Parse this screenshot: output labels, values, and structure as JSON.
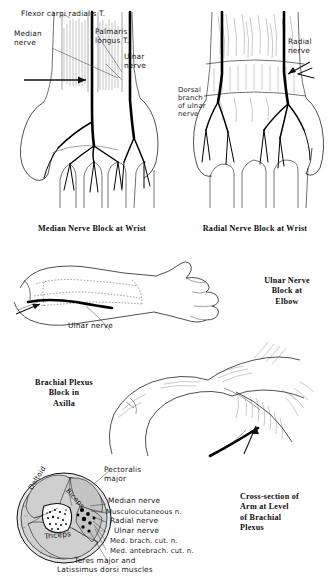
{
  "plate": {
    "title": "Regional nerve block techniques of the upper limb",
    "style": "pen-and-ink anatomical line drawings with handwritten labels"
  },
  "panels": [
    {
      "id": "median-nerve-block-wrist",
      "caption": "Median Nerve Block at Wrist",
      "view": "volar (palmar) aspect of wrist and hand",
      "labels": [
        {
          "name": "flexor-carpi-radialis",
          "text": "Flexor carpi radialis T."
        },
        {
          "name": "median-nerve",
          "text": "Median\nnerve"
        },
        {
          "name": "palmaris-longus",
          "text": "Palmaris\nlongus T."
        },
        {
          "name": "ulnar-nerve",
          "text": "Ulnar\nnerve"
        }
      ]
    },
    {
      "id": "radial-nerve-block-wrist",
      "caption": "Radial Nerve Block at Wrist",
      "view": "dorsal aspect of wrist and hand",
      "labels": [
        {
          "name": "radial-nerve",
          "text": "Radial\nnerve"
        },
        {
          "name": "dorsal-branch-ulnar-nerve",
          "text": "Dorsal\nbranch\nof ulnar\nnerve"
        }
      ]
    },
    {
      "id": "ulnar-nerve-block-elbow",
      "caption": "Ulnar Nerve\nBlock at\nElbow",
      "view": "lateral view of flexed elbow, forearm and hand",
      "labels": [
        {
          "name": "ulnar-nerve",
          "text": "Ulnar nerve"
        }
      ]
    },
    {
      "id": "brachial-plexus-block-axilla",
      "caption": "Brachial Plexus\nBlock in\nAxilla",
      "view": "abducted arm showing axilla with needle insertion",
      "labels": []
    },
    {
      "id": "cross-section-arm",
      "caption": "Cross-section of\nArm at Level\nof Brachial\nPlexus",
      "view": "transverse section through upper arm",
      "inner_labels": [
        {
          "name": "deltoid",
          "text": "Deltoid"
        },
        {
          "name": "biceps",
          "text": "Biceps"
        },
        {
          "name": "triceps",
          "text": "Triceps"
        }
      ],
      "labels": [
        {
          "name": "pectoralis-major",
          "text": "Pectoralis\nmajor"
        },
        {
          "name": "median-nerve",
          "text": "Median nerve"
        },
        {
          "name": "musculocutaneous-nerve",
          "text": "Musculocutaneous n."
        },
        {
          "name": "radial-nerve",
          "text": "Radial nerve"
        },
        {
          "name": "ulnar-nerve",
          "text": "Ulnar nerve"
        },
        {
          "name": "medial-brachial-cutaneous-nerve",
          "text": "Med. brach. cut. n."
        },
        {
          "name": "medial-antebrachial-cutaneous-nerve",
          "text": "Med. antebrach. cut. n."
        },
        {
          "name": "teres-major-latissimus",
          "text": "Teres major and\nLatissimus dorsi muscles"
        }
      ]
    }
  ],
  "colors": {
    "ink": "#141414",
    "paper": "#ffffff",
    "muscle_fill": "#cfcfcf",
    "bone_fill": "#fdfdfd"
  }
}
